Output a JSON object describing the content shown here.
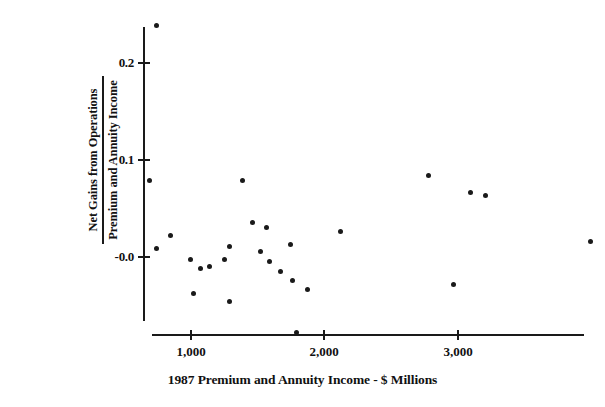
{
  "chart_data": {
    "type": "scatter",
    "title": "",
    "xlabel": "1987 Premium and Annuity Income - $ Millions",
    "ylabel_numerator": "Net Gains from Operations",
    "ylabel_denominator": "Premium and Annuity Income",
    "xticks": [
      1000,
      2000,
      3000
    ],
    "xtick_labels": [
      "1,000",
      "2,000",
      "3,000"
    ],
    "yticks": [
      0.2,
      0.1,
      -0.0
    ],
    "ytick_labels": [
      "0.2",
      "0.1",
      "-0.0"
    ],
    "xlim": [
      615,
      3950
    ],
    "ylim": [
      -0.083,
      0.243
    ],
    "grid": false,
    "legend": null,
    "marker_color": "#1a1a1a",
    "axis_color": "#1a1a1a",
    "points": [
      {
        "x": 740,
        "y": 0.239
      },
      {
        "x": 692,
        "y": 0.079
      },
      {
        "x": 850,
        "y": 0.022
      },
      {
        "x": 745,
        "y": 0.009
      },
      {
        "x": 998,
        "y": -0.003
      },
      {
        "x": 1073,
        "y": -0.012
      },
      {
        "x": 1141,
        "y": -0.01
      },
      {
        "x": 1385,
        "y": 0.079
      },
      {
        "x": 1288,
        "y": 0.011
      },
      {
        "x": 1250,
        "y": -0.003
      },
      {
        "x": 1461,
        "y": 0.036
      },
      {
        "x": 1565,
        "y": 0.03
      },
      {
        "x": 1521,
        "y": 0.006
      },
      {
        "x": 1588,
        "y": -0.005
      },
      {
        "x": 1745,
        "y": 0.013
      },
      {
        "x": 1670,
        "y": -0.015
      },
      {
        "x": 1760,
        "y": -0.024
      },
      {
        "x": 1288,
        "y": -0.046
      },
      {
        "x": 1020,
        "y": -0.038
      },
      {
        "x": 1871,
        "y": -0.033
      },
      {
        "x": 2119,
        "y": 0.026
      },
      {
        "x": 1790,
        "y": -0.078
      },
      {
        "x": 2777,
        "y": 0.084
      },
      {
        "x": 3092,
        "y": 0.067
      },
      {
        "x": 3204,
        "y": 0.063
      },
      {
        "x": 2963,
        "y": -0.028
      },
      {
        "x": 3990,
        "y": 0.016
      }
    ]
  }
}
